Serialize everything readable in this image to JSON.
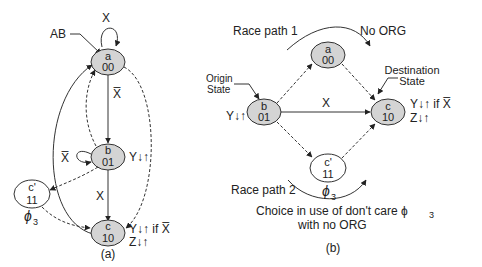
{
  "diagram_a": {
    "caption": "(a)",
    "initial_label": "AB",
    "states": [
      {
        "id": "a",
        "name": "a",
        "code": "00",
        "shaded": true
      },
      {
        "id": "b",
        "name": "b",
        "code": "01",
        "shaded": true
      },
      {
        "id": "cp",
        "name": "c'",
        "code": "11",
        "shaded": false
      },
      {
        "id": "c",
        "name": "c",
        "code": "10",
        "shaded": true
      }
    ],
    "self_loop_a": "X",
    "self_loop_b": "X̅",
    "edge_a_b": "X̅",
    "edge_b_c": "X",
    "output_b": "Y↓↑",
    "output_c_line1": "Y↓↑ if X̅",
    "output_c_line2": "Z↓↑",
    "dont_care": "ϕ",
    "dont_care_sub": "3"
  },
  "diagram_b": {
    "caption": "(b)",
    "race_path_1": "Race path 1",
    "race_path_2": "Race path 2",
    "no_org": "No ORG",
    "origin_label_1": "Origin",
    "origin_label_2": "State",
    "dest_label_1": "Destination",
    "dest_label_2": "State",
    "states": [
      {
        "id": "a",
        "name": "a",
        "code": "00",
        "shaded": true
      },
      {
        "id": "b",
        "name": "b",
        "code": "01",
        "shaded": true
      },
      {
        "id": "c",
        "name": "c",
        "code": "10",
        "shaded": true
      },
      {
        "id": "cp",
        "name": "c'",
        "code": "11",
        "shaded": false
      }
    ],
    "edge_b_c": "X",
    "output_b": "Y↓↑",
    "output_c_line1": "Y↓↑ if X̅",
    "output_c_line2": "Z↓↑",
    "dont_care": "ϕ",
    "dont_care_sub": "3",
    "note_line1": "Choice in use of don't care ϕ",
    "note_sub": "3",
    "note_line2": "with no ORG"
  },
  "colors": {
    "state_fill": "#d4d4d4",
    "stroke": "#333333",
    "bg": "#ffffff"
  }
}
